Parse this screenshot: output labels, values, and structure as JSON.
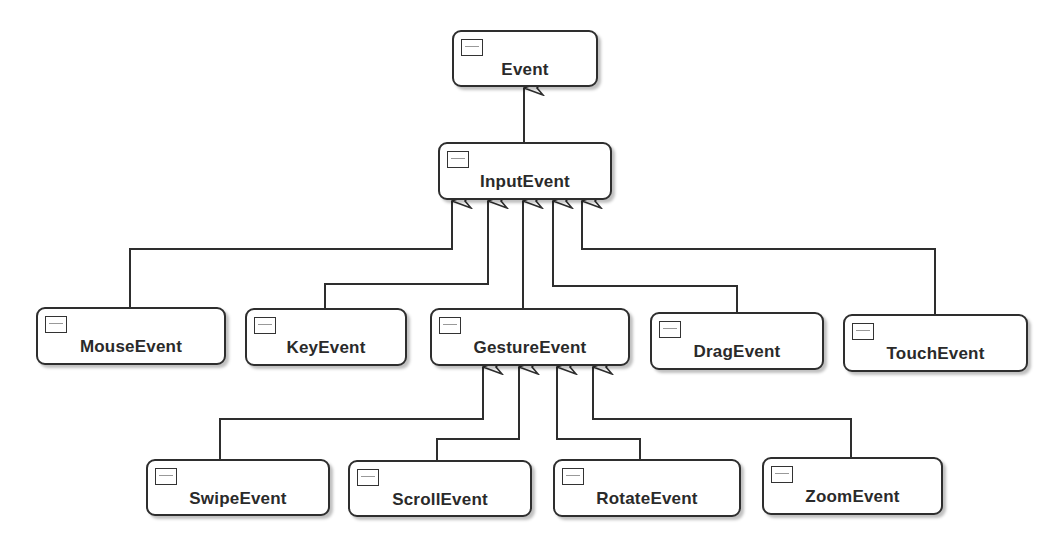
{
  "diagram": {
    "type": "uml-class-inheritance",
    "nodes": [
      {
        "id": "event",
        "label": "Event",
        "x": 452,
        "y": 30,
        "w": 146,
        "h": 57
      },
      {
        "id": "input",
        "label": "InputEvent",
        "x": 438,
        "y": 142,
        "w": 174,
        "h": 58
      },
      {
        "id": "mouse",
        "label": "MouseEvent",
        "x": 36,
        "y": 307,
        "w": 190,
        "h": 58
      },
      {
        "id": "key",
        "label": "KeyEvent",
        "x": 245,
        "y": 308,
        "w": 162,
        "h": 58
      },
      {
        "id": "gesture",
        "label": "GestureEvent",
        "x": 430,
        "y": 308,
        "w": 200,
        "h": 58
      },
      {
        "id": "drag",
        "label": "DragEvent",
        "x": 650,
        "y": 312,
        "w": 174,
        "h": 58
      },
      {
        "id": "touch",
        "label": "TouchEvent",
        "x": 843,
        "y": 314,
        "w": 185,
        "h": 58
      },
      {
        "id": "swipe",
        "label": "SwipeEvent",
        "x": 146,
        "y": 459,
        "w": 184,
        "h": 57
      },
      {
        "id": "scroll",
        "label": "ScrollEvent",
        "x": 348,
        "y": 460,
        "w": 184,
        "h": 57
      },
      {
        "id": "rotate",
        "label": "RotateEvent",
        "x": 553,
        "y": 459,
        "w": 188,
        "h": 58
      },
      {
        "id": "zoom",
        "label": "ZoomEvent",
        "x": 762,
        "y": 457,
        "w": 181,
        "h": 58
      }
    ],
    "edges": [
      {
        "from": "input",
        "to": "event",
        "relation": "extends"
      },
      {
        "from": "mouse",
        "to": "input",
        "relation": "extends"
      },
      {
        "from": "key",
        "to": "input",
        "relation": "extends"
      },
      {
        "from": "gesture",
        "to": "input",
        "relation": "extends"
      },
      {
        "from": "drag",
        "to": "input",
        "relation": "extends"
      },
      {
        "from": "touch",
        "to": "input",
        "relation": "extends"
      },
      {
        "from": "swipe",
        "to": "gesture",
        "relation": "extends"
      },
      {
        "from": "scroll",
        "to": "gesture",
        "relation": "extends"
      },
      {
        "from": "rotate",
        "to": "gesture",
        "relation": "extends"
      },
      {
        "from": "zoom",
        "to": "gesture",
        "relation": "extends"
      }
    ],
    "colors": {
      "stroke": "#2e2e2e",
      "fill": "#ffffff",
      "text": "#2a2a2a"
    }
  }
}
